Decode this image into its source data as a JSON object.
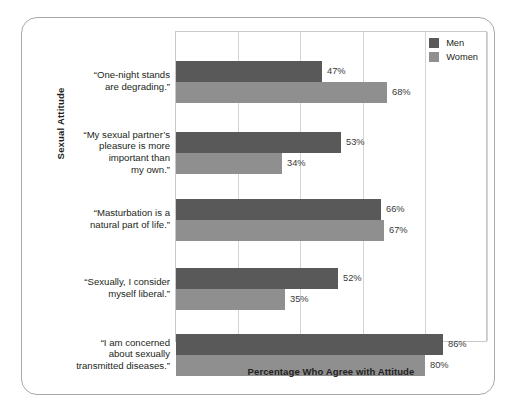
{
  "chart_data": {
    "type": "bar",
    "orientation": "horizontal",
    "title": "",
    "xlabel": "Percentage Who Agree with Attitude",
    "ylabel": "Sexual Attitude",
    "xlim": [
      0,
      100
    ],
    "xtick_values": [
      0,
      20,
      40,
      60,
      80,
      100
    ],
    "grid": true,
    "legend_position": "top-right",
    "categories": [
      "“One-night stands are degrading.”",
      "“My sexual partner’s pleasure is more important than my own.”",
      "“Masturbation is a natural part of life.”",
      "“Sexually, I consider myself liberal.”",
      "“I am concerned about sexually transmitted diseases.”"
    ],
    "category_lines": [
      [
        "“One-night stands",
        "are degrading.”"
      ],
      [
        "“My sexual partner’s",
        "pleasure is more",
        "important than",
        "my own.”"
      ],
      [
        "“Masturbation is a",
        "natural part of life.”"
      ],
      [
        "“Sexually, I consider",
        "myself liberal.”"
      ],
      [
        "“I am concerned",
        "about sexually",
        "transmitted diseases.”"
      ]
    ],
    "series": [
      {
        "name": "Men",
        "color": "#595959",
        "values": [
          47,
          53,
          66,
          52,
          86
        ],
        "labels": [
          "47%",
          "53%",
          "66%",
          "52%",
          "86%"
        ]
      },
      {
        "name": "Women",
        "color": "#8f8f8f",
        "values": [
          68,
          34,
          67,
          35,
          80
        ],
        "labels": [
          "68%",
          "34%",
          "67%",
          "35%",
          "80%"
        ]
      }
    ]
  },
  "legend": {
    "entries": [
      {
        "label": "Men",
        "swatch": "men-swatch"
      },
      {
        "label": "Women",
        "swatch": "women-swatch"
      }
    ]
  },
  "axes": {
    "y_title": "Sexual Attitude",
    "x_title": "Percentage Who Agree with Attitude"
  }
}
